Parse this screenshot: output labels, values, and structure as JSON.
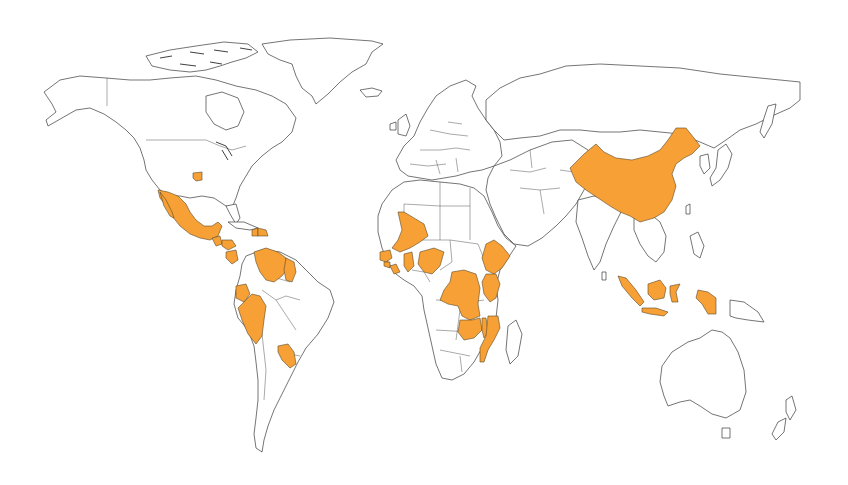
{
  "map": {
    "type": "choropleth",
    "projection": "equirectangular-like",
    "background_color": "#ffffff",
    "outline_color": "#3a3a3a",
    "highlight_color": "#f7a035",
    "base_fill_color": "#ffffff",
    "legend": null,
    "title": null,
    "highlighted_regions": [
      {
        "name": "United States (Four Corners region)",
        "continent": "North America"
      },
      {
        "name": "Mexico",
        "continent": "North America"
      },
      {
        "name": "Guatemala",
        "continent": "North America"
      },
      {
        "name": "Honduras",
        "continent": "North America"
      },
      {
        "name": "Nicaragua",
        "continent": "North America"
      },
      {
        "name": "Haiti",
        "continent": "North America"
      },
      {
        "name": "Dominican Republic",
        "continent": "North America"
      },
      {
        "name": "Venezuela",
        "continent": "South America"
      },
      {
        "name": "Guyana",
        "continent": "South America"
      },
      {
        "name": "Ecuador",
        "continent": "South America"
      },
      {
        "name": "Peru",
        "continent": "South America"
      },
      {
        "name": "Paraguay",
        "continent": "South America"
      },
      {
        "name": "Mali",
        "continent": "Africa"
      },
      {
        "name": "Guinea",
        "continent": "Africa"
      },
      {
        "name": "Sierra Leone",
        "continent": "Africa"
      },
      {
        "name": "Liberia",
        "continent": "Africa"
      },
      {
        "name": "Ghana",
        "continent": "Africa"
      },
      {
        "name": "Nigeria",
        "continent": "Africa"
      },
      {
        "name": "Ethiopia",
        "continent": "Africa"
      },
      {
        "name": "Kenya",
        "continent": "Africa"
      },
      {
        "name": "Democratic Republic of the Congo",
        "continent": "Africa"
      },
      {
        "name": "Zambia",
        "continent": "Africa"
      },
      {
        "name": "Malawi",
        "continent": "Africa"
      },
      {
        "name": "Mozambique",
        "continent": "Africa"
      },
      {
        "name": "China",
        "continent": "Asia"
      },
      {
        "name": "Indonesia",
        "continent": "Asia"
      }
    ]
  }
}
